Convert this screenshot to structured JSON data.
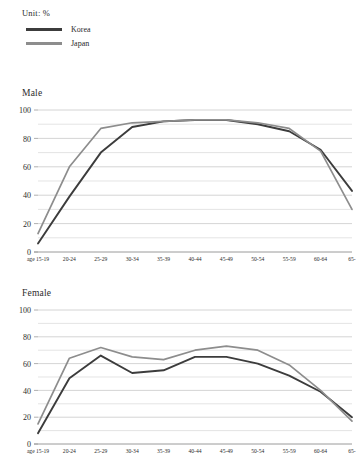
{
  "legend": {
    "unit_label": "Unit: %",
    "series": [
      {
        "name": "Korea",
        "color": "#3c3c3c"
      },
      {
        "name": "Japan",
        "color": "#8d8d8d"
      }
    ]
  },
  "axis": {
    "categories": [
      "age 15-19",
      "20-24",
      "25-29",
      "30-34",
      "35-39",
      "40-44",
      "45-49",
      "50-54",
      "55-59",
      "60-64",
      "65-"
    ],
    "y_ticks": [
      0,
      20,
      40,
      60,
      80,
      100
    ],
    "y_minor_ticks": [
      10,
      30,
      50,
      70,
      90
    ],
    "ymin": 0,
    "ymax": 100
  },
  "charts": [
    {
      "id": "male",
      "title": "Male"
    },
    {
      "id": "female",
      "title": "Female"
    }
  ],
  "chart_data": [
    {
      "type": "line",
      "title": "Male",
      "xlabel": "",
      "ylabel": "",
      "ylim": [
        0,
        100
      ],
      "grid": true,
      "legend_position": "top-left",
      "categories": [
        "age 15-19",
        "20-24",
        "25-29",
        "30-34",
        "35-39",
        "40-44",
        "45-49",
        "50-54",
        "55-59",
        "60-64",
        "65-"
      ],
      "series": [
        {
          "name": "Korea",
          "color": "#3c3c3c",
          "values": [
            6,
            39,
            70,
            88,
            92,
            93,
            93,
            90,
            85,
            72,
            43
          ]
        },
        {
          "name": "Japan",
          "color": "#8d8d8d",
          "values": [
            13,
            60,
            87,
            91,
            92,
            93,
            93,
            91,
            87,
            71,
            30
          ]
        }
      ]
    },
    {
      "type": "line",
      "title": "Female",
      "xlabel": "",
      "ylabel": "",
      "ylim": [
        0,
        100
      ],
      "grid": true,
      "legend_position": "top-left",
      "categories": [
        "age 15-19",
        "20-24",
        "25-29",
        "30-34",
        "35-39",
        "40-44",
        "45-49",
        "50-54",
        "55-59",
        "60-64",
        "65-"
      ],
      "series": [
        {
          "name": "Korea",
          "color": "#3c3c3c",
          "values": [
            8,
            49,
            66,
            53,
            55,
            65,
            65,
            60,
            51,
            39,
            20
          ]
        },
        {
          "name": "Japan",
          "color": "#8d8d8d",
          "values": [
            15,
            64,
            72,
            65,
            63,
            70,
            73,
            70,
            59,
            40,
            17
          ]
        }
      ]
    }
  ]
}
